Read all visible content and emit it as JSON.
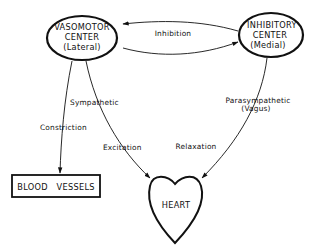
{
  "colors": {
    "background": "#ffffff",
    "ink": "#111111"
  },
  "nodes": {
    "vasomotor": {
      "line1": "VASOMOTOR",
      "line2": "CENTER",
      "line3": "(Lateral)"
    },
    "inhibitory": {
      "line1": "INHIBITORY",
      "line2": "CENTER",
      "line3": "(Medial)"
    },
    "blood_vessels": {
      "label": "BLOOD   VESSELS"
    },
    "heart": {
      "label": "HEART"
    }
  },
  "edges": {
    "inhibition": {
      "label": "Inhibition"
    },
    "sympathetic": {
      "label": "Sympathetic"
    },
    "constriction": {
      "label": "Constriction"
    },
    "excitation": {
      "label": "Excitation"
    },
    "parasympathetic": {
      "line1": "Parasympathetic",
      "line2": "(Vagus)"
    },
    "relaxation": {
      "label": "Relaxation"
    }
  }
}
